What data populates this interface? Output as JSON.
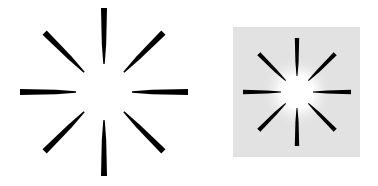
{
  "figures": [
    {
      "id": "left",
      "description": "Eight tapered black spokes radiating around an empty white center on white background",
      "background": "#ffffff",
      "spoke_color": "#000000",
      "spoke_count": 8
    },
    {
      "id": "right",
      "description": "Eight tapered black spokes on light gray square with glowing white center",
      "background": "#e2e2e2",
      "glow_color": "#ffffff",
      "spoke_color": "#000000",
      "spoke_count": 8
    }
  ]
}
